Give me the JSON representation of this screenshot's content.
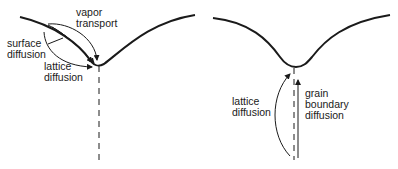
{
  "diagram": {
    "topic": "mass transport mechanisms at a neck between particles",
    "left_panel": {
      "labels": {
        "vapor_transport": "vapor\ntransport",
        "surface_diffusion": "surface\ndiffusion",
        "lattice_diffusion": "lattice\ndiffusion"
      }
    },
    "right_panel": {
      "labels": {
        "lattice_diffusion": "lattice\ndiffusion",
        "grain_boundary_diffusion": "grain\nboundary\ndiffusion"
      }
    },
    "colors": {
      "line": "#1a1a1a",
      "background": "#ffffff"
    }
  }
}
